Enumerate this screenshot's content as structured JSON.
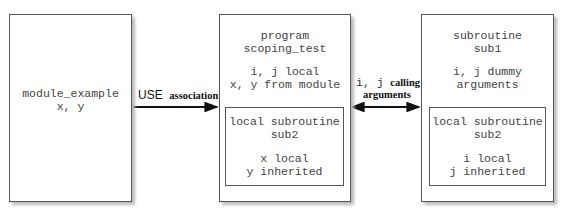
{
  "module_box": {
    "lines": [
      "module_example",
      "x, y"
    ]
  },
  "use_arrow": {
    "keyword": "USE",
    "label": "association"
  },
  "program_box": {
    "title_lines": [
      "program",
      "scoping_test"
    ],
    "var_lines": [
      "i, j local",
      "x, y from module"
    ],
    "inner": {
      "title_lines": [
        "local subroutine",
        "sub2"
      ],
      "var_lines": [
        "x local",
        "y inherited"
      ]
    }
  },
  "call_arrow": {
    "keyword": "i, j",
    "label1": "calling",
    "label2": "arguments"
  },
  "subroutine_box": {
    "title_lines": [
      "subroutine",
      "sub1"
    ],
    "var_lines": [
      "i, j dummy",
      "arguments"
    ],
    "inner": {
      "title_lines": [
        "local subroutine",
        "sub2"
      ],
      "var_lines": [
        "i local",
        "j inherited"
      ]
    }
  }
}
